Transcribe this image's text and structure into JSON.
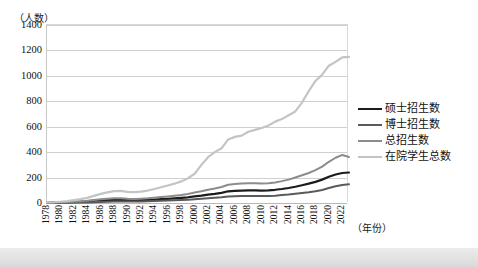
{
  "chart_data": {
    "type": "line",
    "title": "",
    "xlabel": "（年份）",
    "ylabel": "（人数）",
    "ylim": [
      0,
      1400
    ],
    "ytick_step": 200,
    "grid": true,
    "legend_position": "right",
    "x": [
      1978,
      1979,
      1980,
      1981,
      1982,
      1983,
      1984,
      1985,
      1986,
      1987,
      1988,
      1989,
      1990,
      1991,
      1992,
      1993,
      1994,
      1995,
      1996,
      1997,
      1998,
      1999,
      2000,
      2001,
      2002,
      2003,
      2004,
      2005,
      2006,
      2007,
      2008,
      2009,
      2010,
      2011,
      2012,
      2013,
      2014,
      2015,
      2016,
      2017,
      2018,
      2019,
      2020,
      2021,
      2022,
      2023
    ],
    "xtick_labels": [
      "1978",
      "1980",
      "1982",
      "1984",
      "1986",
      "1988",
      "1990",
      "1992",
      "1994",
      "1996",
      "1998",
      "2000",
      "2002",
      "2004",
      "2006",
      "2008",
      "2010",
      "2012",
      "2014",
      "2016",
      "2018",
      "2020",
      "2022"
    ],
    "ytick_labels": [
      "0",
      "200",
      "400",
      "600",
      "800",
      "1000",
      "1200",
      "1400"
    ],
    "series": [
      {
        "name": "硕士招生数",
        "color": "#1c1c1c",
        "width": 2.2,
        "values": [
          2,
          3,
          4,
          6,
          8,
          10,
          13,
          18,
          22,
          24,
          26,
          25,
          22,
          21,
          22,
          24,
          27,
          30,
          33,
          36,
          40,
          45,
          52,
          58,
          66,
          72,
          80,
          92,
          96,
          98,
          100,
          100,
          98,
          100,
          104,
          110,
          118,
          128,
          140,
          152,
          166,
          184,
          206,
          224,
          236,
          240
        ]
      },
      {
        "name": "博士招生数",
        "color": "#5a5a5a",
        "width": 2.0,
        "values": [
          0,
          0,
          1,
          1,
          2,
          3,
          4,
          6,
          8,
          10,
          12,
          12,
          11,
          11,
          12,
          13,
          15,
          17,
          19,
          21,
          23,
          26,
          30,
          34,
          38,
          42,
          46,
          52,
          54,
          55,
          56,
          56,
          55,
          56,
          58,
          62,
          66,
          72,
          78,
          84,
          92,
          102,
          118,
          132,
          142,
          148
        ]
      },
      {
        "name": "总招生数",
        "color": "#8c8c8c",
        "width": 2.0,
        "values": [
          2,
          3,
          5,
          7,
          10,
          13,
          17,
          24,
          30,
          34,
          38,
          37,
          33,
          32,
          34,
          37,
          42,
          47,
          52,
          57,
          63,
          71,
          82,
          92,
          104,
          114,
          126,
          144,
          150,
          153,
          156,
          156,
          153,
          156,
          162,
          172,
          184,
          200,
          218,
          236,
          258,
          286,
          324,
          356,
          378,
          362
        ]
      },
      {
        "name": "在院学生总数",
        "color": "#c4c4c4",
        "width": 2.2,
        "values": [
          4,
          6,
          10,
          15,
          22,
          30,
          40,
          56,
          72,
          84,
          94,
          96,
          88,
          86,
          90,
          98,
          110,
          124,
          138,
          152,
          170,
          195,
          230,
          300,
          360,
          400,
          430,
          500,
          520,
          530,
          560,
          575,
          590,
          610,
          640,
          660,
          690,
          720,
          790,
          880,
          960,
          1010,
          1080,
          1110,
          1145,
          1150
        ]
      }
    ]
  }
}
